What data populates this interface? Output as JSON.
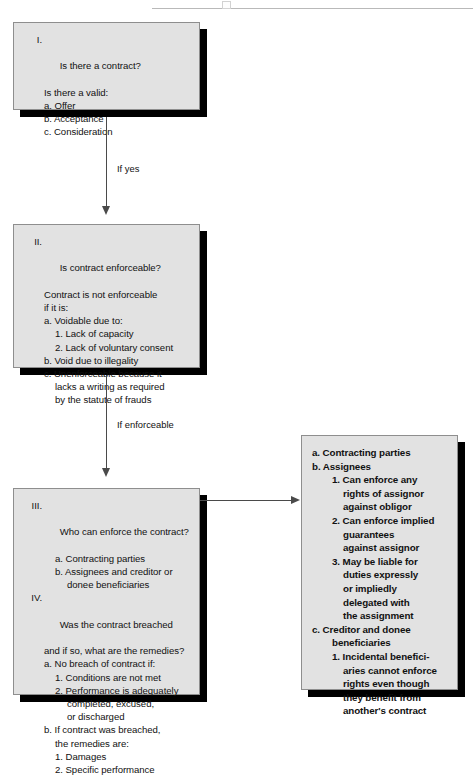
{
  "diagram": {
    "box_fill": "#e2e2e2",
    "box_border": "#8e8e8e",
    "shadow_color": "#000000",
    "connector_color": "#4a4a4a"
  },
  "nodes": {
    "contract": {
      "roman": "I.",
      "lines": [
        {
          "text": "Is there a contract?",
          "indent": 1
        },
        {
          "text": "Is there a valid:",
          "indent": 1
        },
        {
          "text": "a. Offer",
          "indent": 1
        },
        {
          "text": "b. Acceptance",
          "indent": 1
        },
        {
          "text": "c. Consideration",
          "indent": 1
        }
      ]
    },
    "enforceable": {
      "roman": "II.",
      "lines": [
        {
          "text": "Is contract enforceable?",
          "indent": 1
        },
        {
          "text": "Contract is not enforceable",
          "indent": 1
        },
        {
          "text": "if it is:",
          "indent": 1
        },
        {
          "text": "a. Voidable due to:",
          "indent": 1
        },
        {
          "text": "1. Lack of capacity",
          "indent": 2
        },
        {
          "text": "2. Lack of voluntary consent",
          "indent": 2
        },
        {
          "text": "b. Void due to illegality",
          "indent": 1
        },
        {
          "text": "c. Unenforceable because it",
          "indent": 1
        },
        {
          "text": "lacks a writing as required",
          "indent": 2
        },
        {
          "text": "by the statute of frauds",
          "indent": 2
        }
      ]
    },
    "enforce_breach": {
      "roman": "III.",
      "roman2": "IV.",
      "lines": [
        {
          "text": "Who can enforce the contract?",
          "indent": 1,
          "roman": "III."
        },
        {
          "text": "a. Contracting parties",
          "indent": 2
        },
        {
          "text": "b. Assignees and creditor or",
          "indent": 2
        },
        {
          "text": "donee beneficiaries",
          "indent": 3
        },
        {
          "text": "Was the contract breached",
          "indent": 1,
          "roman": "IV."
        },
        {
          "text": "and if so, what are the remedies?",
          "indent": 1
        },
        {
          "text": "a. No breach of contract if:",
          "indent": 1
        },
        {
          "text": "1. Conditions are not met",
          "indent": 2
        },
        {
          "text": "2. Performance is adequately",
          "indent": 2
        },
        {
          "text": "completed, excused,",
          "indent": 3
        },
        {
          "text": "or discharged",
          "indent": 3
        },
        {
          "text": "b. If contract was breached,",
          "indent": 1
        },
        {
          "text": "the remedies are:",
          "indent": 2
        },
        {
          "text": "1. Damages",
          "indent": 2
        },
        {
          "text": "2. Specific performance",
          "indent": 2
        }
      ]
    },
    "who_enforce": {
      "lines": [
        {
          "text": "a. Contracting parties",
          "indent": 0
        },
        {
          "text": "b. Assignees",
          "indent": 0
        },
        {
          "text": "1. Can enforce any",
          "indent": 1
        },
        {
          "text": "rights of assignor",
          "indent": 2
        },
        {
          "text": "against obligor",
          "indent": 2
        },
        {
          "text": "2. Can enforce implied",
          "indent": 1
        },
        {
          "text": "guarantees",
          "indent": 2
        },
        {
          "text": "against assignor",
          "indent": 2
        },
        {
          "text": "3. May be liable for",
          "indent": 1
        },
        {
          "text": "duties expressly",
          "indent": 2
        },
        {
          "text": "or impliedly",
          "indent": 2
        },
        {
          "text": "delegated with",
          "indent": 2
        },
        {
          "text": "the assignment",
          "indent": 2
        },
        {
          "text": "c. Creditor and donee",
          "indent": 0
        },
        {
          "text": "beneficiaries",
          "indent": 1
        },
        {
          "text": "1. Incidental benefici-",
          "indent": 1
        },
        {
          "text": "aries cannot enforce",
          "indent": 2
        },
        {
          "text": "rights even though",
          "indent": 2
        },
        {
          "text": "they benefit from",
          "indent": 2
        },
        {
          "text": "another's contract",
          "indent": 2
        }
      ]
    }
  },
  "edges": {
    "yes": {
      "label": "If yes"
    },
    "enforceable": {
      "label": "If enforceable"
    },
    "to_who_enforce": {
      "label": ""
    }
  }
}
